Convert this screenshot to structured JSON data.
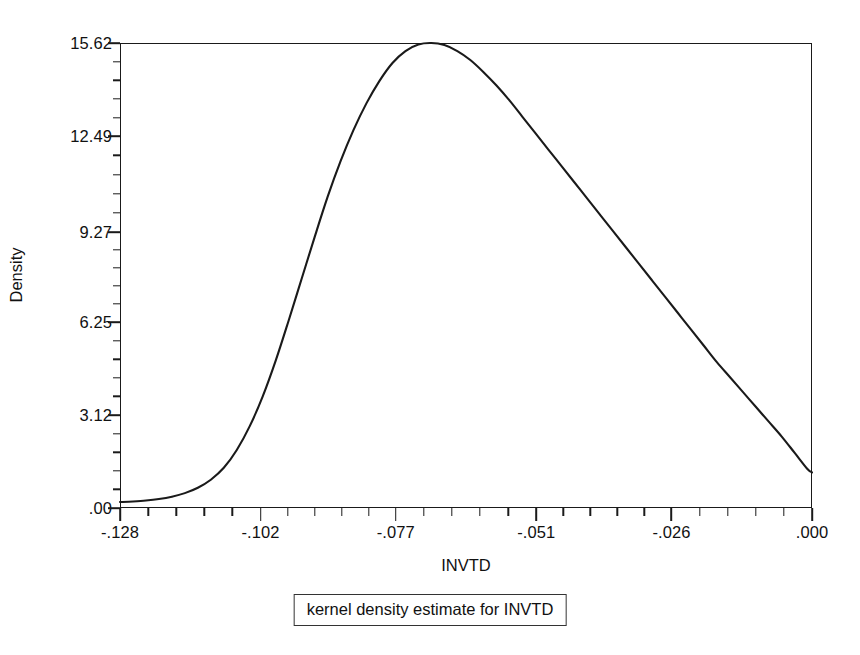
{
  "chart_data": {
    "type": "line",
    "title": "",
    "subtitle": "",
    "caption": "kernel density estimate for INVTD",
    "xlabel": "INVTD",
    "ylabel": "Density",
    "xlim": [
      -0.128,
      0.0
    ],
    "ylim": [
      0.0,
      15.62
    ],
    "grid": false,
    "legend": null,
    "x_tick_labels": [
      ".000",
      "-.026",
      "-.051",
      "-.077",
      "-.102",
      "-.128"
    ],
    "x_tick_values": [
      0.0,
      -0.026,
      -0.051,
      -0.077,
      -0.102,
      -0.128
    ],
    "y_tick_labels": [
      "15.62",
      "12.49",
      "9.27",
      "6.25",
      "3.12",
      ".00"
    ],
    "y_tick_values": [
      15.62,
      12.49,
      9.27,
      6.25,
      3.12,
      0.0
    ],
    "minor_ticks_between_majors": 4,
    "series": [
      {
        "name": "kernel density estimate for INVTD",
        "color": "#1a1a1a",
        "x": [
          -0.128,
          -0.1256,
          -0.1232,
          -0.1208,
          -0.1184,
          -0.116,
          -0.1136,
          -0.1112,
          -0.1088,
          -0.1064,
          -0.104,
          -0.1016,
          -0.0992,
          -0.0968,
          -0.0944,
          -0.092,
          -0.0896,
          -0.0872,
          -0.0848,
          -0.0824,
          -0.08,
          -0.0776,
          -0.0752,
          -0.0728,
          -0.0704,
          -0.068,
          -0.0656,
          -0.0632,
          -0.0608,
          -0.0584,
          -0.056,
          -0.0536,
          -0.0512,
          -0.0488,
          -0.0464,
          -0.044,
          -0.0416,
          -0.0392,
          -0.0368,
          -0.0344,
          -0.032,
          -0.0296,
          -0.0272,
          -0.0248,
          -0.0224,
          -0.02,
          -0.0176,
          -0.0152,
          -0.0128,
          -0.0104,
          -0.008,
          -0.0056,
          -0.0032,
          -0.0008,
          0.0
        ],
        "y": [
          0.2,
          0.22,
          0.25,
          0.3,
          0.38,
          0.5,
          0.68,
          0.95,
          1.35,
          1.95,
          2.75,
          3.75,
          4.95,
          6.3,
          7.7,
          9.1,
          10.45,
          11.65,
          12.7,
          13.6,
          14.35,
          14.95,
          15.35,
          15.57,
          15.62,
          15.55,
          15.35,
          15.05,
          14.65,
          14.2,
          13.7,
          13.15,
          12.6,
          12.05,
          11.5,
          10.95,
          10.4,
          9.85,
          9.3,
          8.75,
          8.2,
          7.65,
          7.1,
          6.55,
          6.0,
          5.45,
          4.9,
          4.4,
          3.9,
          3.4,
          2.9,
          2.4,
          1.85,
          1.3,
          1.2
        ],
        "peak_x": -0.0704,
        "peak_y": 15.62
      }
    ]
  },
  "axes": {
    "y_title": "Density",
    "x_title": "INVTD"
  },
  "caption": {
    "text": "kernel density estimate for INVTD"
  },
  "colors": {
    "curve": "#1a1a1a",
    "frame": "#1a1a1a",
    "text": "#111111",
    "background": "#ffffff"
  }
}
